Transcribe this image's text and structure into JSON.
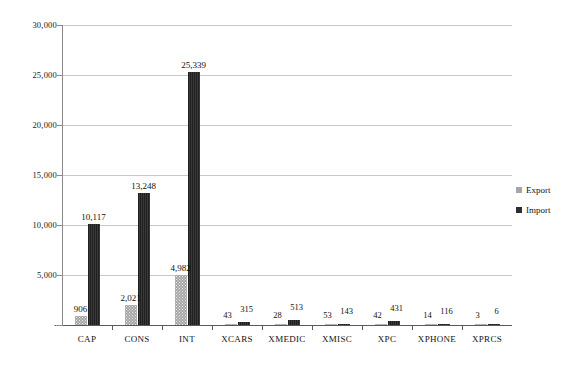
{
  "chart_data": {
    "type": "bar",
    "title": "",
    "subtitle": "",
    "xlabel": "",
    "ylabel": "",
    "ylim": [
      0,
      30000
    ],
    "ytick_values": [
      0,
      5000,
      10000,
      15000,
      20000,
      25000,
      30000
    ],
    "ytick_labels": [
      "-",
      "5,000",
      "10,000",
      "15,000",
      "20,000",
      "25,000",
      "30,000"
    ],
    "grid": true,
    "legend_position": "right",
    "categories": [
      "CAP",
      "CONS",
      "INT",
      "XCARS",
      "XMEDIC",
      "XMISC",
      "XPC",
      "XPHONE",
      "XPRCS"
    ],
    "series": [
      {
        "name": "Export",
        "color": "#a6a6a6",
        "values": [
          906,
          2021,
          4982,
          43,
          28,
          53,
          42,
          14,
          3
        ],
        "labels": [
          "906",
          "2,021",
          "4,982",
          "43",
          "28",
          "53",
          "42",
          "14",
          "3"
        ]
      },
      {
        "name": "Import",
        "color": "#2e2e2e",
        "values": [
          10117,
          13248,
          25339,
          315,
          513,
          143,
          431,
          116,
          6
        ],
        "labels": [
          "10,117",
          "13,248",
          "25,339",
          "315",
          "513",
          "143",
          "431",
          "116",
          "6"
        ]
      }
    ]
  },
  "legend": {
    "items": [
      {
        "label": "Export",
        "swatch": "export"
      },
      {
        "label": "Import",
        "swatch": "import"
      }
    ]
  }
}
